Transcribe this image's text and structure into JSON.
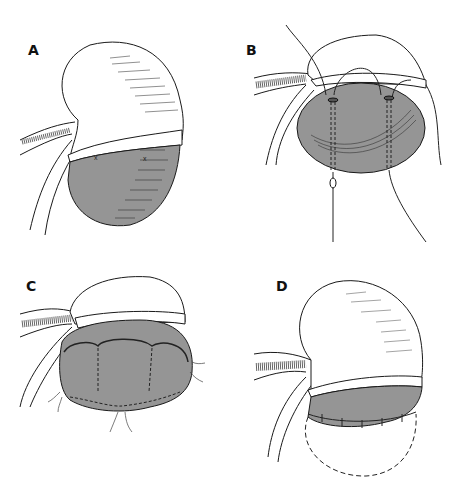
{
  "figure": {
    "type": "medical-illustration",
    "panels": [
      {
        "id": "A",
        "label": "A",
        "annotations": [
          "x",
          "x"
        ]
      },
      {
        "id": "B",
        "label": "B"
      },
      {
        "id": "C",
        "label": "C"
      },
      {
        "id": "D",
        "label": "D"
      }
    ]
  },
  "colors": {
    "tissue_fill": "#959595",
    "outline": "#1a1a1a",
    "background": "#ffffff",
    "hatch": "#555555"
  }
}
